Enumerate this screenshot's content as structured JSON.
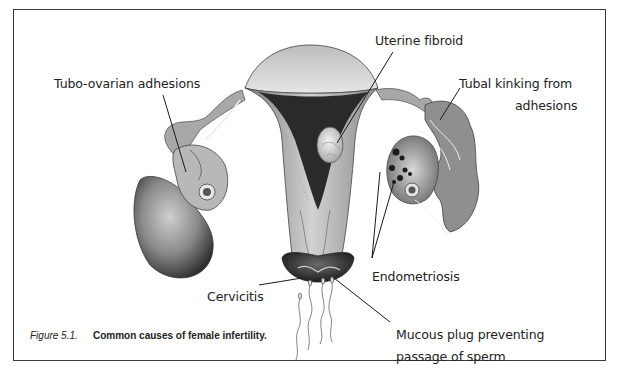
{
  "figure": {
    "number": "Figure 5.1.",
    "title": "Common causes of female infertility."
  },
  "labels": {
    "uterine_fibroid": "Uterine fibroid",
    "tubo_ovarian": "Tubo-ovarian adhesions",
    "tubal_kinking_line1": "Tubal kinking from",
    "tubal_kinking_line2": "adhesions",
    "endometriosis": "Endometriosis",
    "cervicitis": "Cervicitis",
    "mucous_plug_line1": "Mucous plug preventing",
    "mucous_plug_line2": "passage of sperm"
  },
  "colors": {
    "frame": "#3a3a3a",
    "tissue_light": "#d6d6d6",
    "tissue_mid": "#9a9a9a",
    "tissue_dark": "#3c3c3c",
    "cavity": "#2a2a2a",
    "leader": "#1a1a1a"
  }
}
